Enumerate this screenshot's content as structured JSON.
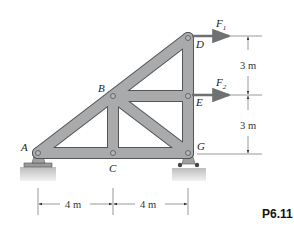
{
  "figure": {
    "problem_id": "P6.11",
    "colors": {
      "member_fill": "#a9aaab",
      "member_stroke": "#555555",
      "arrow": "#6f7072",
      "ground": "#c8c8c8",
      "dimension": "#555555"
    },
    "joints": {
      "A": {
        "label": "A",
        "x": 38,
        "y": 153
      },
      "B": {
        "label": "B",
        "x": 113,
        "y": 96
      },
      "C": {
        "label": "C",
        "x": 113,
        "y": 153
      },
      "D": {
        "label": "D",
        "x": 188,
        "y": 38
      },
      "E": {
        "label": "E",
        "x": 188,
        "y": 96
      },
      "G": {
        "label": "G",
        "x": 188,
        "y": 153
      }
    },
    "members": [
      "AB",
      "BD",
      "AC",
      "CG",
      "BC",
      "BE",
      "DE",
      "EG",
      "BG"
    ],
    "loads": [
      {
        "name": "F",
        "subscript": "1",
        "joint": "D",
        "direction": "right"
      },
      {
        "name": "F",
        "subscript": "2",
        "joint": "E",
        "direction": "right"
      }
    ],
    "supports": [
      {
        "joint": "A",
        "type": "pin"
      },
      {
        "joint": "G",
        "type": "roller"
      }
    ],
    "dimensions": {
      "horizontal": [
        "4 m",
        "4 m"
      ],
      "vertical": [
        "3 m",
        "3 m"
      ]
    }
  }
}
